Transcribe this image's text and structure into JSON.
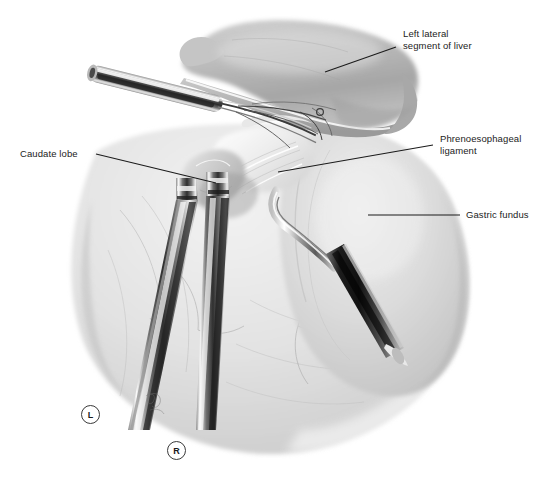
{
  "figure": {
    "type": "medical-illustration",
    "style": "grayscale pencil / wash anatomical drawing",
    "background_color": "#ffffff",
    "ink_color": "#222222"
  },
  "labels": [
    {
      "id": "left-lateral-segment-of-liver",
      "text": "Left lateral\nsegment of liver",
      "x": 403,
      "y": 33,
      "leader": {
        "x1": 396,
        "y1": 47,
        "x2": 325,
        "y2": 72
      }
    },
    {
      "id": "phrenoesophageal-ligament",
      "text": "Phrenoesophageal\nligament",
      "x": 440,
      "y": 138,
      "leader": {
        "x1": 433,
        "y1": 145,
        "x2": 278,
        "y2": 172
      }
    },
    {
      "id": "caudate-lobe",
      "text": "Caudate lobe",
      "x": 20,
      "y": 149,
      "leader": {
        "x1": 96,
        "y1": 154,
        "x2": 216,
        "y2": 183
      }
    },
    {
      "id": "gastric-fundus",
      "text": "Gastric fundus",
      "x": 466,
      "y": 209,
      "leader": {
        "x1": 368,
        "y1": 215,
        "x2": 460,
        "y2": 215
      }
    }
  ],
  "orientation_markers": [
    {
      "id": "left",
      "text": "L",
      "x": 89,
      "y": 413
    },
    {
      "id": "right",
      "text": "R",
      "x": 175,
      "y": 449
    }
  ],
  "caption": {
    "text": "",
    "y": 482
  },
  "anatomy_regions": [
    {
      "name": "left-lateral-segment-of-liver",
      "tone": "#b9b9b9"
    },
    {
      "name": "gastric-fundus",
      "tone": "#d9d9d9"
    },
    {
      "name": "caudate-lobe",
      "tone": "#cdcdcd"
    },
    {
      "name": "phrenoesophageal-ligament",
      "tone": "#efefef"
    },
    {
      "name": "stomach-body",
      "tone": "#e2e2e2"
    }
  ],
  "instruments": [
    {
      "name": "upper-left-retractor-blade",
      "orientation": "diagonal-upper-left"
    },
    {
      "name": "left-deep-retractor",
      "orientation": "vertical-descending"
    },
    {
      "name": "center-deep-retractor",
      "orientation": "vertical-descending"
    },
    {
      "name": "right-hook-retractor",
      "orientation": "diagonal-lower-right"
    }
  ]
}
